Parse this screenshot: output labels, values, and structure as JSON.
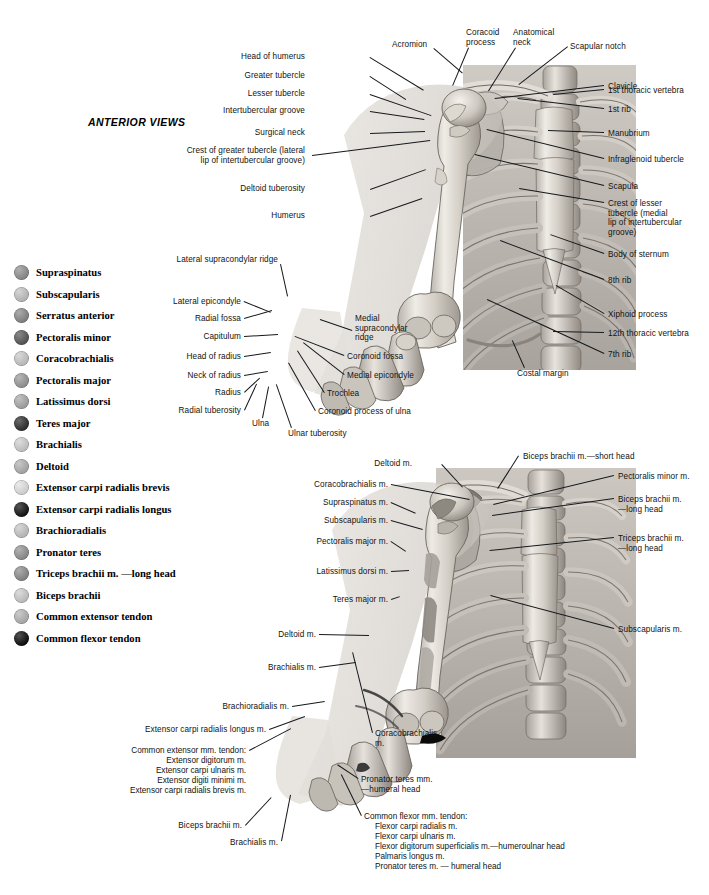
{
  "page": {
    "title": "ANTERIOR VIEWS",
    "width": 709,
    "height": 895,
    "background": "#ffffff",
    "text_color": "#121212"
  },
  "legend": {
    "items": [
      {
        "label": "Supraspinatus",
        "color": "#8e8e8e"
      },
      {
        "label": "Subscapularis",
        "color": "#c3c3c3"
      },
      {
        "label": "Serratus anterior",
        "color": "#878787"
      },
      {
        "label": "Pectoralis minor",
        "color": "#555555"
      },
      {
        "label": "Coracobrachialis",
        "color": "#c9c9c9"
      },
      {
        "label": "Pectoralis major",
        "color": "#989898"
      },
      {
        "label": "Latissimus dorsi",
        "color": "#a8a8a8"
      },
      {
        "label": "Teres major",
        "color": "#2a2a2a"
      },
      {
        "label": "Brachialis",
        "color": "#cfcfcf"
      },
      {
        "label": "Deltoid",
        "color": "#b0b0b0"
      },
      {
        "label": "Extensor carpi radialis brevis",
        "color": "#e2e2e2"
      },
      {
        "label": "Extensor carpi radialis longus",
        "color": "#0d0d0d"
      },
      {
        "label": "Brachioradialis",
        "color": "#c6c6c6"
      },
      {
        "label": "Pronator teres",
        "color": "#919191"
      },
      {
        "label": "Triceps brachii m. —long head",
        "color": "#8a8a8a"
      },
      {
        "label": "Biceps brachii",
        "color": "#cccccc"
      },
      {
        "label": "Common extensor tendon",
        "color": "#b4b4b4"
      },
      {
        "label": "Common flexor tendon",
        "color": "#060606"
      }
    ]
  },
  "figure_top": {
    "name": "anterior-skeletal-view",
    "labels_left": [
      {
        "text": "Head of humerus",
        "x": 305,
        "y": 52,
        "align": "right",
        "leader": {
          "x1": 370,
          "y1": 57,
          "x2": 424,
          "y2": 90
        }
      },
      {
        "text": "Greater tubercle",
        "x": 305,
        "y": 71,
        "align": "right",
        "leader": {
          "x1": 370,
          "y1": 76,
          "x2": 406,
          "y2": 99
        }
      },
      {
        "text": "Lesser tubercle",
        "x": 305,
        "y": 89,
        "align": "right",
        "leader": {
          "x1": 370,
          "y1": 94,
          "x2": 431,
          "y2": 115
        }
      },
      {
        "text": "Intertubercular groove",
        "x": 305,
        "y": 106,
        "align": "right",
        "leader": {
          "x1": 370,
          "y1": 111,
          "x2": 424,
          "y2": 119
        }
      },
      {
        "text": "Surgical neck",
        "x": 305,
        "y": 128,
        "align": "right",
        "leader": {
          "x1": 370,
          "y1": 133,
          "x2": 425,
          "y2": 131
        }
      },
      {
        "text": "Crest of greater tubercle (lateral\nlip of intertubercular groove)",
        "x": 305,
        "y": 146,
        "align": "right",
        "leader": {
          "x1": 312,
          "y1": 155,
          "x2": 430,
          "y2": 140
        }
      },
      {
        "text": "Deltoid tuberosity",
        "x": 305,
        "y": 184,
        "align": "right",
        "leader": {
          "x1": 370,
          "y1": 189,
          "x2": 426,
          "y2": 169
        }
      },
      {
        "text": "Humerus",
        "x": 305,
        "y": 211,
        "align": "right",
        "leader": {
          "x1": 370,
          "y1": 216,
          "x2": 422,
          "y2": 198
        }
      }
    ],
    "labels_top": [
      {
        "text": "Acromion",
        "x": 392,
        "y": 40,
        "align": "left",
        "leader": {
          "x1": 434,
          "y1": 48,
          "x2": 463,
          "y2": 73
        }
      },
      {
        "text": "Coracoid\nprocess",
        "x": 466,
        "y": 28,
        "align": "left",
        "leader": {
          "x1": 469,
          "y1": 48,
          "x2": 453,
          "y2": 86
        }
      },
      {
        "text": "Anatomical\nneck",
        "x": 513,
        "y": 28,
        "align": "left",
        "leader": {
          "x1": 516,
          "y1": 48,
          "x2": 489,
          "y2": 91
        }
      },
      {
        "text": "Scapular notch",
        "x": 570,
        "y": 42,
        "align": "left",
        "leader": {
          "x1": 568,
          "y1": 47,
          "x2": 519,
          "y2": 85
        }
      }
    ],
    "labels_right": [
      {
        "text": "Clavicle",
        "x": 608,
        "y": 82,
        "align": "left",
        "leader": {
          "x1": 604,
          "y1": 86,
          "x2": 495,
          "y2": 99
        }
      },
      {
        "text": "1st thoracic vertebra",
        "x": 608,
        "y": 86,
        "align": "left",
        "leader": {
          "x1": 604,
          "y1": 90,
          "x2": 553,
          "y2": 95
        }
      },
      {
        "text": "1st rib",
        "x": 608,
        "y": 105,
        "align": "left",
        "leader": {
          "x1": 604,
          "y1": 109,
          "x2": 518,
          "y2": 99
        }
      },
      {
        "text": "Manubrium",
        "x": 608,
        "y": 129,
        "align": "left",
        "leader": {
          "x1": 604,
          "y1": 133,
          "x2": 548,
          "y2": 131
        }
      },
      {
        "text": "Infraglenoid tubercle",
        "x": 608,
        "y": 155,
        "align": "left",
        "leader": {
          "x1": 604,
          "y1": 159,
          "x2": 487,
          "y2": 130
        }
      },
      {
        "text": "Scapula",
        "x": 608,
        "y": 182,
        "align": "left",
        "leader": {
          "x1": 604,
          "y1": 186,
          "x2": 475,
          "y2": 155
        }
      },
      {
        "text": "Crest of lesser\ntubercle (medial\nlip of intertubercular\ngroove)",
        "x": 608,
        "y": 199,
        "align": "left",
        "leader": {
          "x1": 604,
          "y1": 203,
          "x2": 519,
          "y2": 189
        }
      },
      {
        "text": "Body of sternum",
        "x": 608,
        "y": 250,
        "align": "left",
        "leader": {
          "x1": 604,
          "y1": 254,
          "x2": 550,
          "y2": 235
        }
      },
      {
        "text": "8th rib",
        "x": 608,
        "y": 276,
        "align": "left",
        "leader": {
          "x1": 604,
          "y1": 280,
          "x2": 500,
          "y2": 241
        }
      },
      {
        "text": "Xiphoid process",
        "x": 608,
        "y": 310,
        "align": "left",
        "leader": {
          "x1": 604,
          "y1": 314,
          "x2": 556,
          "y2": 286
        }
      },
      {
        "text": "12th thoracic vertebra",
        "x": 608,
        "y": 329,
        "align": "left",
        "leader": {
          "x1": 604,
          "y1": 333,
          "x2": 553,
          "y2": 332
        }
      },
      {
        "text": "7th rib",
        "x": 608,
        "y": 350,
        "align": "left",
        "leader": {
          "x1": 604,
          "y1": 354,
          "x2": 487,
          "y2": 300
        }
      },
      {
        "text": "Costal margin",
        "x": 517,
        "y": 369,
        "align": "left",
        "leader": {
          "x1": 524,
          "y1": 368,
          "x2": 512,
          "y2": 341
        }
      }
    ],
    "labels_elbow": [
      {
        "text": "Lateral supracondylar ridge",
        "x": 278,
        "y": 255,
        "align": "right",
        "leader": {
          "x1": 281,
          "y1": 264,
          "x2": 288,
          "y2": 296
        }
      },
      {
        "text": "Lateral epicondyle",
        "x": 241,
        "y": 297,
        "align": "right",
        "leader": {
          "x1": 244,
          "y1": 301,
          "x2": 271,
          "y2": 312
        }
      },
      {
        "text": "Radial fossa",
        "x": 241,
        "y": 314,
        "align": "right",
        "leader": {
          "x1": 244,
          "y1": 318,
          "x2": 272,
          "y2": 310
        }
      },
      {
        "text": "Capitulum",
        "x": 241,
        "y": 332,
        "align": "right",
        "leader": {
          "x1": 244,
          "y1": 336,
          "x2": 278,
          "y2": 334
        }
      },
      {
        "text": "Head of radius",
        "x": 241,
        "y": 352,
        "align": "right",
        "leader": {
          "x1": 244,
          "y1": 356,
          "x2": 271,
          "y2": 352
        }
      },
      {
        "text": "Neck of radius",
        "x": 241,
        "y": 371,
        "align": "right",
        "leader": {
          "x1": 244,
          "y1": 375,
          "x2": 268,
          "y2": 371
        }
      },
      {
        "text": "Radius",
        "x": 241,
        "y": 388,
        "align": "right",
        "leader": {
          "x1": 244,
          "y1": 392,
          "x2": 259,
          "y2": 378
        }
      },
      {
        "text": "Radial tuberosity",
        "x": 241,
        "y": 406,
        "align": "right",
        "leader": {
          "x1": 244,
          "y1": 410,
          "x2": 256,
          "y2": 384
        }
      },
      {
        "text": "Ulna",
        "x": 252,
        "y": 419,
        "align": "left",
        "leader": {
          "x1": 262,
          "y1": 418,
          "x2": 268,
          "y2": 387
        }
      },
      {
        "text": "Ulnar tuberosity",
        "x": 288,
        "y": 429,
        "align": "left",
        "leader": {
          "x1": 291,
          "y1": 428,
          "x2": 276,
          "y2": 385
        }
      },
      {
        "text": "Medial\nsupracondylar\nridge",
        "x": 355,
        "y": 314,
        "align": "left",
        "leader": {
          "x1": 352,
          "y1": 331,
          "x2": 320,
          "y2": 320
        }
      },
      {
        "text": "Coronoid fossa",
        "x": 347,
        "y": 352,
        "align": "left",
        "leader": {
          "x1": 344,
          "y1": 356,
          "x2": 295,
          "y2": 337
        }
      },
      {
        "text": "Medial epicondyle",
        "x": 347,
        "y": 371,
        "align": "left",
        "leader": {
          "x1": 344,
          "y1": 375,
          "x2": 303,
          "y2": 343
        }
      },
      {
        "text": "Trochlea",
        "x": 327,
        "y": 389,
        "align": "left",
        "leader": {
          "x1": 324,
          "y1": 393,
          "x2": 297,
          "y2": 351
        }
      },
      {
        "text": "Coronoid process of ulna",
        "x": 318,
        "y": 407,
        "align": "left",
        "leader": {
          "x1": 315,
          "y1": 411,
          "x2": 288,
          "y2": 363
        }
      }
    ]
  },
  "figure_bottom": {
    "name": "anterior-muscular-attachment-view",
    "labels_left": [
      {
        "text": "Deltoid m.",
        "x": 412,
        "y": 459,
        "align": "right",
        "leader": {
          "x1": 442,
          "y1": 464,
          "x2": 463,
          "y2": 487
        }
      },
      {
        "text": "Coracobrachialis m.",
        "x": 388,
        "y": 480,
        "align": "right",
        "leader": {
          "x1": 391,
          "y1": 484,
          "x2": 470,
          "y2": 499
        }
      },
      {
        "text": "Supraspinatus m.",
        "x": 388,
        "y": 498,
        "align": "right",
        "leader": {
          "x1": 391,
          "y1": 502,
          "x2": 416,
          "y2": 513
        }
      },
      {
        "text": "Subscapularis m.",
        "x": 388,
        "y": 516,
        "align": "right",
        "leader": {
          "x1": 391,
          "y1": 520,
          "x2": 423,
          "y2": 529
        }
      },
      {
        "text": "Pectoralis major m.",
        "x": 388,
        "y": 537,
        "align": "right",
        "leader": {
          "x1": 391,
          "y1": 541,
          "x2": 406,
          "y2": 551
        }
      },
      {
        "text": "Latissimus dorsi m.",
        "x": 388,
        "y": 567,
        "align": "right",
        "leader": {
          "x1": 391,
          "y1": 571,
          "x2": 409,
          "y2": 570
        }
      },
      {
        "text": "Teres major m.",
        "x": 388,
        "y": 595,
        "align": "right",
        "leader": {
          "x1": 391,
          "y1": 599,
          "x2": 400,
          "y2": 596
        }
      },
      {
        "text": "Deltoid m.",
        "x": 316,
        "y": 630,
        "align": "right",
        "leader": {
          "x1": 319,
          "y1": 634,
          "x2": 369,
          "y2": 635
        }
      },
      {
        "text": "Brachialis m.",
        "x": 316,
        "y": 663,
        "align": "right",
        "leader": {
          "x1": 319,
          "y1": 667,
          "x2": 356,
          "y2": 662
        }
      },
      {
        "text": "Brachioradialis m.",
        "x": 289,
        "y": 702,
        "align": "right",
        "leader": {
          "x1": 292,
          "y1": 706,
          "x2": 325,
          "y2": 701
        }
      },
      {
        "text": "Extensor carpi radialis longus m.",
        "x": 266,
        "y": 725,
        "align": "right",
        "leader": {
          "x1": 269,
          "y1": 729,
          "x2": 305,
          "y2": 716
        }
      },
      {
        "text": "Biceps brachii m.",
        "x": 242,
        "y": 821,
        "align": "right",
        "leader": {
          "x1": 245,
          "y1": 825,
          "x2": 271,
          "y2": 797
        }
      },
      {
        "text": "Brachialis m.",
        "x": 278,
        "y": 838,
        "align": "right",
        "leader": {
          "x1": 281,
          "y1": 841,
          "x2": 290,
          "y2": 795
        }
      },
      {
        "text": "Coracobrachialis\nm.",
        "x": 375,
        "y": 729,
        "align": "left",
        "leader": {
          "x1": 372,
          "y1": 733,
          "x2": 352,
          "y2": 652
        }
      }
    ],
    "labels_right": [
      {
        "text": "Biceps brachii m.—short head",
        "x": 523,
        "y": 452,
        "align": "left",
        "leader": {
          "x1": 519,
          "y1": 456,
          "x2": 498,
          "y2": 489
        }
      },
      {
        "text": "Pectoralis minor m.",
        "x": 618,
        "y": 472,
        "align": "left",
        "leader": {
          "x1": 614,
          "y1": 476,
          "x2": 493,
          "y2": 505
        }
      },
      {
        "text": "Biceps brachii m.\n—long head",
        "x": 618,
        "y": 495,
        "align": "left",
        "leader": {
          "x1": 614,
          "y1": 499,
          "x2": 492,
          "y2": 516
        }
      },
      {
        "text": "Triceps brachii m.\n—long head",
        "x": 618,
        "y": 534,
        "align": "left",
        "leader": {
          "x1": 614,
          "y1": 538,
          "x2": 490,
          "y2": 551
        }
      },
      {
        "text": "Subscapularis m.",
        "x": 618,
        "y": 625,
        "align": "left",
        "leader": {
          "x1": 614,
          "y1": 629,
          "x2": 490,
          "y2": 596
        }
      }
    ],
    "common_extensor": {
      "heading": "Common extensor mm. tendon:",
      "x": 246,
      "y": 746,
      "align": "right",
      "leader": {
        "x1": 249,
        "y1": 750,
        "x2": 291,
        "y2": 728
      },
      "items": [
        "Extensor digitorum m.",
        "Extensor carpi ulnaris m.",
        "Extensor digiti minimi m.",
        "Extensor carpi radialis brevis m."
      ]
    },
    "pronator_teres": {
      "text": "Pronator teres mm.\n—humeral head",
      "x": 361,
      "y": 775,
      "align": "left",
      "leader": {
        "x1": 358,
        "y1": 779,
        "x2": 337,
        "y2": 765
      }
    },
    "common_flexor": {
      "heading": "Common flexor mm. tendon:",
      "x": 364,
      "y": 812,
      "align": "left",
      "leader": {
        "x1": 361,
        "y1": 816,
        "x2": 341,
        "y2": 775
      },
      "items": [
        "Flexor carpi radialis m.",
        "Flexor carpi ulnaris m.",
        "Flexor digitorum superficialis m.—humeroulnar head",
        "Palmaris longus m.",
        "Pronator teres m. — humeral head"
      ]
    }
  }
}
